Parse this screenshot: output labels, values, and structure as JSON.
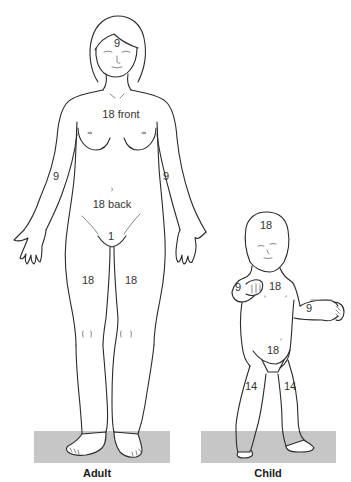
{
  "diagram": {
    "colors": {
      "line": "#2a2a2a",
      "ground": "#c6c6c6",
      "text": "#333333",
      "background": "#ffffff"
    },
    "adult": {
      "caption": "Adult",
      "labels": {
        "head": "9",
        "trunk_front": "18 front",
        "trunk_back": "18 back",
        "arm_right": "9",
        "arm_left": "9",
        "perineum": "1",
        "leg_right": "18",
        "leg_left": "18"
      }
    },
    "child": {
      "caption": "Child",
      "labels": {
        "head": "18",
        "trunk_front": "18",
        "trunk_back": "18",
        "arm_right": "9",
        "arm_left": "9",
        "leg_right": "14",
        "leg_left": "14"
      }
    }
  }
}
